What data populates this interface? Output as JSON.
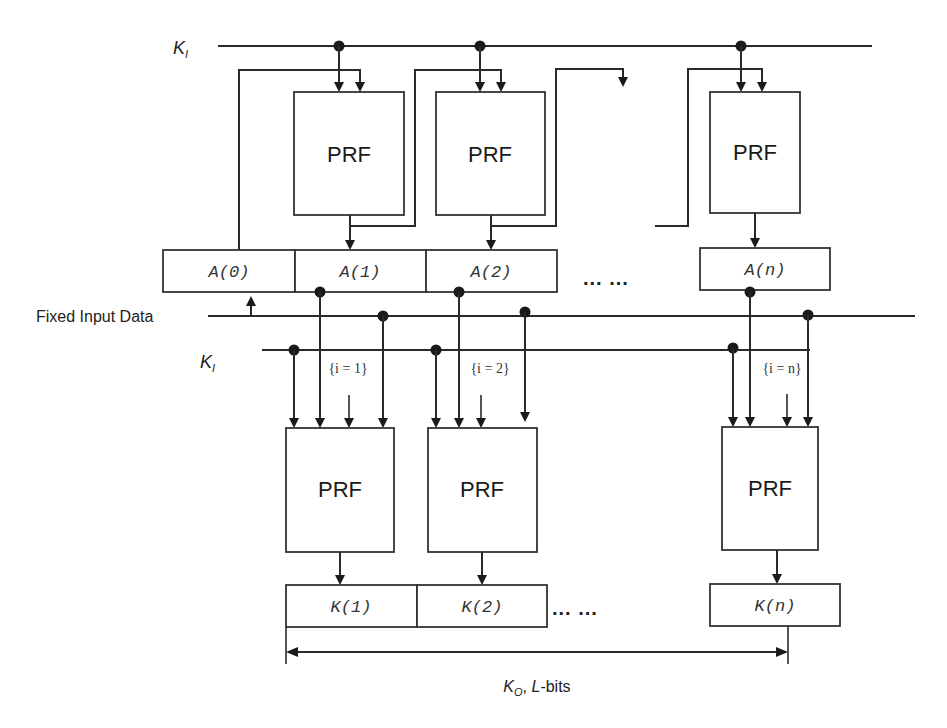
{
  "diagram": {
    "title": "",
    "key_input_label": "K",
    "key_input_subscript": "I",
    "fixed_input_label": "Fixed Input Data",
    "top_stage": {
      "prf_blocks": [
        {
          "label": "PRF"
        },
        {
          "label": "PRF"
        },
        {
          "label": "PRF"
        }
      ],
      "registers": [
        {
          "label": "A(0)"
        },
        {
          "label": "A(1)"
        },
        {
          "label": "A(2)"
        },
        {
          "label": "A(n)"
        }
      ],
      "ellipsis": "... ..."
    },
    "bottom_stage": {
      "prf_blocks": [
        {
          "label": "PRF",
          "index_label": "{i = 1}"
        },
        {
          "label": "PRF",
          "index_label": "{i = 2}"
        },
        {
          "label": "PRF",
          "index_label": "{i = n}"
        }
      ],
      "registers": [
        {
          "label": "K(1)"
        },
        {
          "label": "K(2)"
        },
        {
          "label": "K(n)"
        }
      ],
      "ellipsis": "... ..."
    },
    "output_label": {
      "key": "K",
      "subscript": "O",
      "suffix_italic": "L",
      "suffix": "-bits",
      "separator": ", "
    }
  },
  "colors": {
    "line": "#2a2a2a",
    "background": "#ffffff"
  }
}
